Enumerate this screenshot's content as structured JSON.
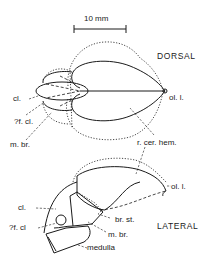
{
  "figure": {
    "scale_bar": {
      "label": "10 mm"
    },
    "dorsal": {
      "view_label": "DORSAL",
      "labels": {
        "cl": "cl.",
        "f_cl": "?f. cl.",
        "m_br": "m. br.",
        "ol_l": "ol. l.",
        "r_cer_hem": "r. cer. hem."
      }
    },
    "lateral": {
      "view_label": "LATERAL",
      "labels": {
        "cl": "cl.",
        "f_cl": "?f. cl",
        "ol_l": "ol. l.",
        "br_st": "br. st.",
        "m_br": "m. br.",
        "medulla": "medulla"
      }
    }
  }
}
